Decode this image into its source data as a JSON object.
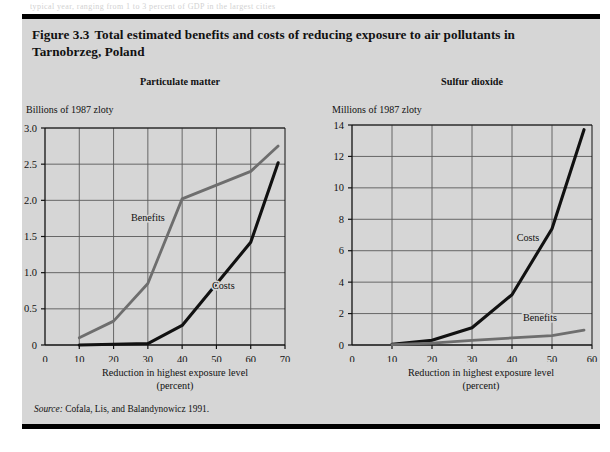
{
  "page": {
    "background_color": "#d6d6d6",
    "rule_color": "#000000",
    "bleed_text": "typical year, ranging from 1 to 3 percent of GDP in the largest cities"
  },
  "figure": {
    "number": "Figure 3.3",
    "title": "Total estimated benefits and costs of reducing exposure to air pollutants in Tarnobrzeg, Poland",
    "source": {
      "lead": "Source:",
      "text": "Cofala, Lis, and Balandynowicz 1991."
    }
  },
  "colors": {
    "costs": "#111111",
    "benefits": "#6e6e6e",
    "grid": "#5a5a5a",
    "axis": "#111111",
    "panel_bg": "#d6d6d6"
  },
  "chart_data": [
    {
      "type": "line",
      "title": "Particulate matter",
      "ylabel": "Billions of 1987 zloty",
      "xlabel": "Reduction in highest exposure level\n(percent)",
      "xlabel_line1": "Reduction in highest exposure level",
      "xlabel_line2": "(percent)",
      "xlim": [
        0,
        70
      ],
      "ylim": [
        0,
        3.0
      ],
      "xticks": [
        0,
        10,
        20,
        30,
        40,
        50,
        60,
        70
      ],
      "yticks": [
        0,
        0.5,
        1.0,
        1.5,
        2.0,
        2.5,
        3.0
      ],
      "xticklabels": [
        "0",
        "10",
        "20",
        "30",
        "40",
        "50",
        "60",
        "70"
      ],
      "yticklabels": [
        "0",
        "0.5",
        "1.0",
        "1.5",
        "2.0",
        "2.5",
        "3.0"
      ],
      "grid": true,
      "legend": "inline-annotations",
      "series": [
        {
          "name": "Benefits",
          "color": "#6e6e6e",
          "label_x": 30,
          "label_y": 1.72,
          "x": [
            10,
            20,
            30,
            40,
            60,
            68
          ],
          "y": [
            0.1,
            0.33,
            0.85,
            2.02,
            2.4,
            2.75
          ]
        },
        {
          "name": "Costs",
          "color": "#111111",
          "label_x": 52,
          "label_y": 0.78,
          "x": [
            10,
            30,
            40,
            60,
            68
          ],
          "y": [
            0.0,
            0.02,
            0.27,
            1.42,
            2.52
          ]
        }
      ]
    },
    {
      "type": "line",
      "title": "Sulfur dioxide",
      "ylabel": "Millions of 1987 zloty",
      "xlabel": "Reduction in highest exposure level\n(percent)",
      "xlabel_line1": "Reduction in highest exposure level",
      "xlabel_line2": "(percent)",
      "xlim": [
        0,
        60
      ],
      "ylim": [
        0,
        14
      ],
      "xticks": [
        0,
        10,
        20,
        30,
        40,
        50,
        60
      ],
      "yticks": [
        0,
        2,
        4,
        6,
        8,
        10,
        12,
        14
      ],
      "xticklabels": [
        "0",
        "10",
        "20",
        "30",
        "40",
        "50",
        "60"
      ],
      "yticklabels": [
        "0",
        "2",
        "4",
        "6",
        "8",
        "10",
        "12",
        "14"
      ],
      "grid": true,
      "legend": "inline-annotations",
      "series": [
        {
          "name": "Costs",
          "color": "#111111",
          "label_x": 44,
          "label_y": 6.6,
          "x": [
            10,
            20,
            30,
            40,
            50,
            58
          ],
          "y": [
            0.05,
            0.3,
            1.1,
            3.2,
            7.4,
            13.7
          ]
        },
        {
          "name": "Benefits",
          "color": "#6e6e6e",
          "label_x": 47,
          "label_y": 1.55,
          "x": [
            10,
            20,
            30,
            40,
            50,
            58
          ],
          "y": [
            0.02,
            0.12,
            0.3,
            0.45,
            0.6,
            0.95
          ]
        }
      ]
    }
  ]
}
